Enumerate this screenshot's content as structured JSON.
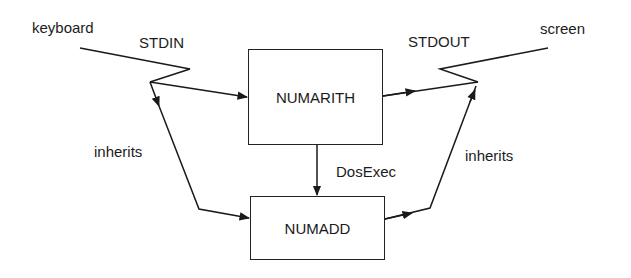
{
  "diagram": {
    "nodes": {
      "numarith": {
        "label": "NUMARITH"
      },
      "numadd": {
        "label": "NUMADD"
      }
    },
    "endpoints": {
      "keyboard": {
        "label": "keyboard"
      },
      "screen": {
        "label": "screen"
      }
    },
    "handles": {
      "stdin": {
        "label": "STDIN"
      },
      "stdout": {
        "label": "STDOUT"
      }
    },
    "edge_labels": {
      "dosexec": "DosExec",
      "inherits_left": "inherits",
      "inherits_right": "inherits"
    },
    "edges": [
      {
        "from": "keyboard",
        "to": "STDIN",
        "style": "lightning"
      },
      {
        "from": "STDIN",
        "to": "NUMARITH",
        "arrow": true
      },
      {
        "from": "STDIN",
        "to": "NUMADD",
        "label": "inherits",
        "arrow": true
      },
      {
        "from": "NUMARITH",
        "to": "NUMADD",
        "label": "DosExec",
        "arrow": true
      },
      {
        "from": "NUMARITH",
        "to": "STDOUT",
        "arrow": true
      },
      {
        "from": "NUMADD",
        "to": "STDOUT",
        "label": "inherits",
        "arrow": true
      },
      {
        "from": "STDOUT",
        "to": "screen",
        "style": "lightning"
      }
    ],
    "colors": {
      "line": "#1a1a1a",
      "background": "#ffffff"
    }
  }
}
